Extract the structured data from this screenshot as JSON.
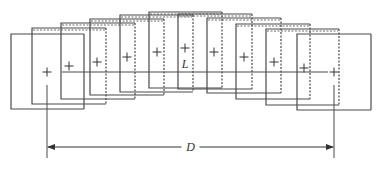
{
  "diagram": {
    "type": "overlapping-frames",
    "labels": {
      "length": "L",
      "distance": "D"
    },
    "colors": {
      "stroke": "#4a4a4a",
      "background": "#ffffff"
    },
    "frames": [
      {
        "x": 11,
        "y": 34,
        "w": 73,
        "h": 75,
        "cx": 47,
        "cy": 72,
        "dashed_right": false
      },
      {
        "x": 32,
        "y": 28,
        "w": 74,
        "h": 76,
        "cx": 69,
        "cy": 66,
        "dashed_right": true
      },
      {
        "x": 61,
        "y": 23,
        "w": 74,
        "h": 76,
        "cx": 97,
        "cy": 62,
        "dashed_right": true
      },
      {
        "x": 90,
        "y": 19,
        "w": 74,
        "h": 76,
        "cx": 127,
        "cy": 57,
        "dashed_right": true
      },
      {
        "x": 120,
        "y": 15,
        "w": 73,
        "h": 77,
        "cx": 157,
        "cy": 52,
        "dashed_right": true
      },
      {
        "x": 149,
        "y": 12,
        "w": 73,
        "h": 76,
        "cx": 185,
        "cy": 48,
        "dashed_right": true
      },
      {
        "x": 178,
        "y": 14,
        "w": 74,
        "h": 75,
        "cx": 214,
        "cy": 52,
        "dashed_right": true
      },
      {
        "x": 207,
        "y": 18,
        "w": 74,
        "h": 75,
        "cx": 244,
        "cy": 57,
        "dashed_right": true
      },
      {
        "x": 236,
        "y": 24,
        "w": 74,
        "h": 75,
        "cx": 274,
        "cy": 62,
        "dashed_right": true
      },
      {
        "x": 266,
        "y": 29,
        "w": 73,
        "h": 76,
        "cx": 304,
        "cy": 68,
        "dashed_right": true
      },
      {
        "x": 297,
        "y": 34,
        "w": 74,
        "h": 76,
        "cx": 334,
        "cy": 72,
        "dashed_right": false
      }
    ],
    "baseline": {
      "x1": 62,
      "x2": 328,
      "y": 72
    },
    "dimension": {
      "x1": 47,
      "x2": 334,
      "y": 147,
      "ext_top": 85,
      "ext_bottom": 158
    }
  }
}
